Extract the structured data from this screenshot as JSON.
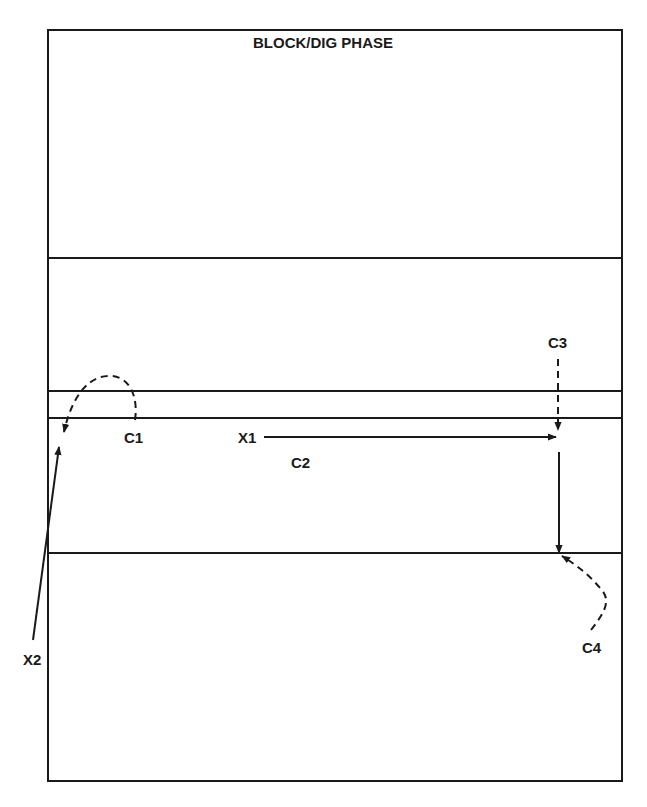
{
  "diagram": {
    "title": "BLOCK/DIG PHASE",
    "colors": {
      "line": "#1a1a1a",
      "background": "#ffffff"
    },
    "court": {
      "border": {
        "x1": 48,
        "y1": 30,
        "x2": 622,
        "y2": 781
      },
      "lines_y": [
        258,
        391,
        418,
        553
      ]
    },
    "labels": {
      "c1": "C1",
      "c2": "C2",
      "c3": "C3",
      "c4": "C4",
      "x1": "X1",
      "x2": "X2"
    },
    "arrows": [
      {
        "id": "x1-run",
        "style": "solid",
        "from": "X1",
        "description": "horizontal arrow to right"
      },
      {
        "id": "x2-run",
        "style": "solid",
        "from": "X2",
        "description": "diagonal arrow up to left court edge"
      },
      {
        "id": "c1-move",
        "style": "dashed",
        "from": "C1",
        "description": "curved dashed arc to upper left"
      },
      {
        "id": "c3-move",
        "style": "dashed",
        "from": "C3",
        "description": "vertical dashed arrow down"
      },
      {
        "id": "c2-move",
        "style": "solid",
        "from": "C2",
        "description": "vertical arrow down on right side"
      },
      {
        "id": "c4-move",
        "style": "dashed",
        "from": "C4",
        "description": "curved dashed arrow up-left"
      }
    ]
  }
}
